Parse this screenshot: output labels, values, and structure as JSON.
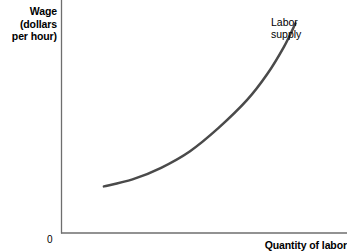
{
  "chart_data": {
    "type": "line",
    "title": "",
    "ylabel": "Wage (dollars per hour)",
    "xlabel": "Quantity of labor",
    "ylabel_lines": [
      "Wage",
      "(dollars",
      "per hour)"
    ],
    "origin_label": "0",
    "grid": false,
    "legend": "none",
    "axis_ticks": [],
    "xlim": [
      0,
      100
    ],
    "ylim": [
      0,
      100
    ],
    "series": [
      {
        "name": "Labor supply",
        "annotation": "Labor supply",
        "annotation_lines": [
          "Labor",
          "supply"
        ],
        "color": "#4a4a4a",
        "points": [
          {
            "x": 15,
            "y": 20
          },
          {
            "x": 25,
            "y": 23
          },
          {
            "x": 35,
            "y": 28
          },
          {
            "x": 45,
            "y": 35
          },
          {
            "x": 55,
            "y": 45
          },
          {
            "x": 65,
            "y": 57
          },
          {
            "x": 72,
            "y": 68
          },
          {
            "x": 78,
            "y": 80
          },
          {
            "x": 82,
            "y": 90
          }
        ]
      }
    ],
    "colors": {
      "curve": "#4a4a4a",
      "axis": "#6e6e6e",
      "text": "#000000",
      "background": "#ffffff"
    }
  }
}
